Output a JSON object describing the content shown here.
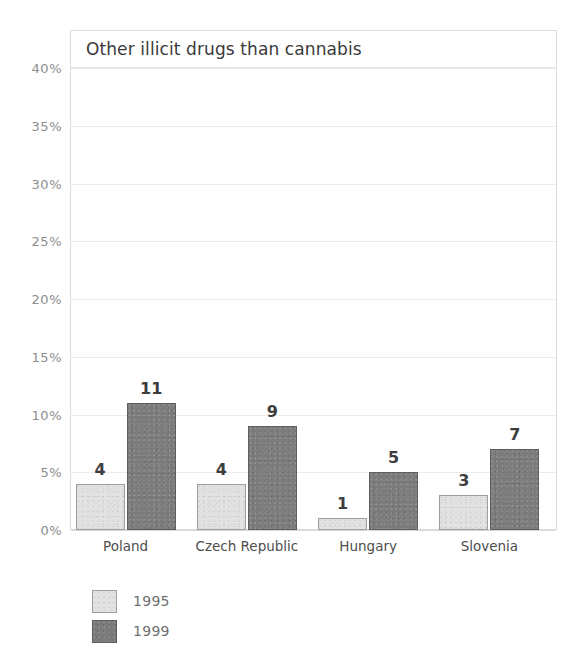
{
  "chart_data": {
    "type": "bar",
    "title": "Other illicit drugs than cannabis",
    "xlabel": "",
    "ylabel": "",
    "ylim": [
      0,
      40
    ],
    "ytick_values": [
      40,
      35,
      30,
      25,
      20,
      15,
      10,
      5,
      0
    ],
    "ytick_labels": [
      "40%",
      "35%",
      "30%",
      "25%",
      "20%",
      "15%",
      "10%",
      "5%",
      "0%"
    ],
    "grid": true,
    "legend_position": "below-left",
    "categories": [
      "Poland",
      "Czech Republic",
      "Hungary",
      "Slovenia"
    ],
    "series": [
      {
        "name": "1995",
        "color": "#e2e2e2",
        "values": [
          4,
          4,
          1,
          3
        ],
        "labels": [
          "4",
          "4",
          "1",
          "3"
        ]
      },
      {
        "name": "1999",
        "color": "#7b7b7b",
        "values": [
          11,
          9,
          5,
          7
        ],
        "labels": [
          "11",
          "9",
          "5",
          "7"
        ]
      }
    ]
  },
  "legend": {
    "entries": [
      {
        "label": "1995",
        "color": "#e2e2e2"
      },
      {
        "label": "1999",
        "color": "#7b7b7b"
      }
    ]
  },
  "colors": {
    "series_1995": "#e2e2e2",
    "series_1999": "#7b7b7b",
    "gridline": "#ececec",
    "axis_text": "#8d8d8d",
    "title_text": "#3b3b3b",
    "background": "#ffffff"
  }
}
